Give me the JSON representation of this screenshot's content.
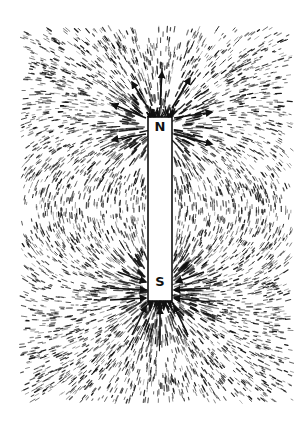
{
  "figure": {
    "poles": [
      {
        "label": "N",
        "position": "top"
      },
      {
        "label": "S",
        "position": "bottom"
      }
    ],
    "arrows": {
      "north": "pointing outward",
      "south": "pointing inward"
    },
    "colors": {
      "ink": "#111111",
      "background": "#ffffff"
    }
  }
}
